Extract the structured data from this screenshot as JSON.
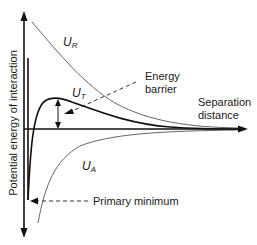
{
  "diagram": {
    "y_axis_label": "Potential energy of interaction",
    "x_axis_label_line1": "Separation",
    "x_axis_label_line2": "distance",
    "curves": {
      "repulsive": {
        "symbol": "U",
        "subscript": "R"
      },
      "total": {
        "symbol": "U",
        "subscript": "T"
      },
      "attractive": {
        "symbol": "U",
        "subscript": "A"
      }
    },
    "annotations": {
      "energy_barrier_line1": "Energy",
      "energy_barrier_line2": "barrier",
      "primary_minimum": "Primary minimum"
    },
    "colors": {
      "axis": "#1a1a1a",
      "thin_curve": "#666666",
      "thick_curve": "#111111",
      "text": "#1a1a1a"
    }
  }
}
